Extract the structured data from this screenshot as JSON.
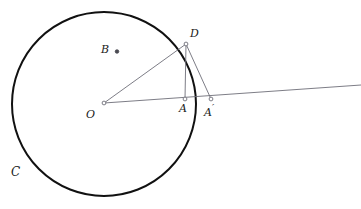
{
  "figure": {
    "type": "geometry-diagram",
    "width": 361,
    "height": 209,
    "background_color": "#ffffff",
    "stroke_color_primary": "#111111",
    "stroke_color_construction": "#6e6e78",
    "point_marker_color": "#6e6e78"
  },
  "circle": {
    "name": "C",
    "label": "C",
    "label_display": "C",
    "center_x": 104,
    "center_y": 104,
    "radius": 92,
    "stroke_width": 2,
    "color": "#111111"
  },
  "points": [
    {
      "id": "O",
      "label": "O",
      "x": 104,
      "y": 103,
      "label_x": 88,
      "label_y": 110,
      "marker": "open-circle"
    },
    {
      "id": "D",
      "label": "D",
      "x": 186,
      "y": 44,
      "label_x": 190,
      "label_y": 30,
      "marker": "open-circle"
    },
    {
      "id": "A",
      "label": "A",
      "x": 185,
      "y": 99,
      "label_x": 179,
      "label_y": 105,
      "marker": "open-circle"
    },
    {
      "id": "Aprime",
      "label": "A",
      "prime": "′",
      "x": 211,
      "y": 99,
      "label_x": 205,
      "label_y": 105,
      "marker": "open-circle"
    },
    {
      "id": "B",
      "label": "B",
      "x": 117,
      "y": 52,
      "label_x": 102,
      "label_y": 44,
      "marker": "filled-dot"
    }
  ],
  "segments": [
    {
      "id": "O-D",
      "from": "O",
      "to": "D",
      "x1": 104,
      "y1": 103,
      "x2": 186,
      "y2": 44,
      "color": "#6e6e78",
      "width": 1
    },
    {
      "id": "O-Aprime-ray",
      "from": "O",
      "to": "ray-right",
      "x1": 104,
      "y1": 103,
      "x2": 361,
      "y2": 85,
      "color": "#6e6e78",
      "width": 1
    },
    {
      "id": "D-A",
      "from": "D",
      "to": "A",
      "x1": 186,
      "y1": 44,
      "x2": 185,
      "y2": 99,
      "color": "#6e6e78",
      "width": 1
    },
    {
      "id": "D-Aprime",
      "from": "D",
      "to": "Aprime",
      "x1": 186,
      "y1": 44,
      "x2": 211,
      "y2": 99,
      "color": "#6e6e78",
      "width": 1
    }
  ],
  "labels": {
    "circle_label": "C",
    "center_label": "O",
    "point_d_label": "D",
    "point_a_label": "A",
    "point_aprime_label": "A",
    "point_aprime_prime": "′",
    "point_b_label": "B"
  },
  "label_positions": {
    "circle_label_x": 11,
    "circle_label_y": 166
  }
}
